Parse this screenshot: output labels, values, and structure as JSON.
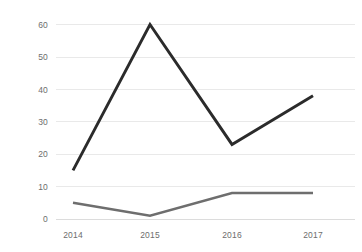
{
  "chart_data": {
    "type": "line",
    "title": "",
    "subtitle": "",
    "xlabel": "",
    "ylabel": "",
    "categories": [
      "2014",
      "2015",
      "2016",
      "2017"
    ],
    "series": [
      {
        "name": "Series 1",
        "values": [
          15,
          60,
          23,
          38
        ],
        "color": "#2b2b2b"
      },
      {
        "name": "Series 2",
        "values": [
          5,
          1,
          8,
          8
        ],
        "color": "#6e6e6e"
      }
    ],
    "ylim": [
      0,
      60
    ],
    "yticks": [
      0,
      10,
      20,
      30,
      40,
      50,
      60
    ],
    "ytick_labels": [
      "0",
      "10",
      "20",
      "30",
      "40",
      "50",
      "60"
    ],
    "xtick_labels": [
      "2014",
      "2015",
      "2016",
      "2017"
    ],
    "grid": true,
    "grid_axis": "y",
    "legend": false,
    "legend_position": "none",
    "annotations": [],
    "background_color": "#ffffff",
    "grid_color": "#e9e9e9",
    "tick_label_color": "#6d6d6d"
  },
  "axes": {
    "y_tick_0": "0",
    "y_tick_1": "10",
    "y_tick_2": "20",
    "y_tick_3": "30",
    "y_tick_4": "40",
    "y_tick_5": "50",
    "y_tick_6": "60",
    "x_tick_0": "2014",
    "x_tick_1": "2015",
    "x_tick_2": "2016",
    "x_tick_3": "2017"
  }
}
